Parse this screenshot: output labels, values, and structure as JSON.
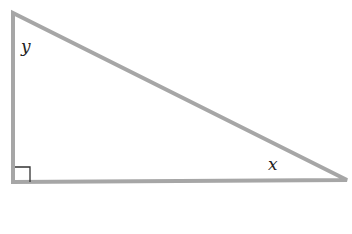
{
  "diagram": {
    "type": "right-triangle",
    "colors": {
      "triangle_stroke": "#a6a6a6",
      "right_angle_marker": "#333333",
      "label_text": "#222222",
      "background": "#ffffff"
    },
    "vertices": {
      "top": [
        13,
        13
      ],
      "right_angle": [
        13,
        182
      ],
      "right": [
        347,
        180
      ]
    },
    "labels": {
      "top_angle": "y",
      "right_angle_label": "x"
    },
    "right_angle_marker": true
  }
}
